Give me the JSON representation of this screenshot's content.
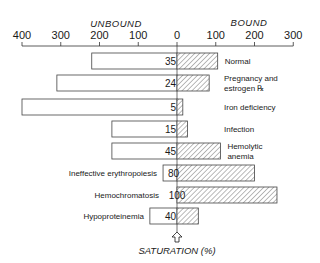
{
  "chart_data": {
    "type": "bar",
    "orientation": "horizontal-diverging",
    "title": "",
    "left_group_label": "UNBOUND",
    "right_group_label": "BOUND",
    "axis": {
      "min": -400,
      "max": 300,
      "ticks": [
        -400,
        -300,
        -200,
        -100,
        0,
        100,
        200,
        300
      ],
      "tick_labels": [
        "400",
        "300",
        "200",
        "100",
        "0",
        "100",
        "200",
        "300"
      ]
    },
    "footer_label": "SATURATION (%)",
    "footer_icon": "up-arrow-outline-icon",
    "categories": [
      {
        "label_lines": [
          "Normal"
        ],
        "label_side": "right",
        "unbound": 220,
        "bound": 105,
        "saturation": "35"
      },
      {
        "label_lines": [
          "Pregnancy and",
          "estrogen ℞"
        ],
        "label_side": "right",
        "unbound": 310,
        "bound": 83,
        "saturation": "24"
      },
      {
        "label_lines": [
          "Iron deficiency"
        ],
        "label_side": "right",
        "unbound": 400,
        "bound": 15,
        "saturation": "5"
      },
      {
        "label_lines": [
          "Infection"
        ],
        "label_side": "right",
        "unbound": 168,
        "bound": 27,
        "saturation": "15"
      },
      {
        "label_lines": [
          "Hemolytic",
          "anemia"
        ],
        "label_side": "right",
        "unbound": 168,
        "bound": 112,
        "saturation": "45"
      },
      {
        "label_lines": [
          "Ineffective erythropoiesis"
        ],
        "label_side": "left",
        "unbound": 36,
        "bound": 200,
        "saturation": "80"
      },
      {
        "label_lines": [
          "Hemochromatosis"
        ],
        "label_side": "left",
        "unbound": 0,
        "bound": 258,
        "saturation": "100"
      },
      {
        "label_lines": [
          "Hypoproteinemia"
        ],
        "label_side": "left",
        "unbound": 70,
        "bound": 55,
        "saturation": "40"
      }
    ],
    "series": [
      {
        "name": "Unbound",
        "fill": "#ffffff"
      },
      {
        "name": "Bound",
        "fill": "hatched"
      }
    ],
    "grid": false,
    "legend": "none"
  }
}
